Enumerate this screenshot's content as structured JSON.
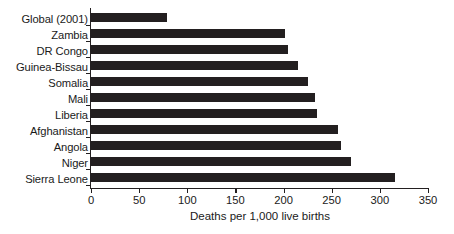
{
  "chart_data": {
    "type": "bar",
    "orientation": "horizontal",
    "title": "",
    "xlabel": "Deaths per 1,000 live births",
    "ylabel": "",
    "xlim": [
      0,
      350
    ],
    "xticks": [
      0,
      50,
      100,
      150,
      200,
      250,
      300,
      350
    ],
    "grid": false,
    "legend": false,
    "bar_color": "#231f20",
    "categories": [
      "Global (2001)",
      "Zambia",
      "DR Congo",
      "Guinea-Bissau",
      "Somalia",
      "Mali",
      "Liberia",
      "Afghanistan",
      "Angola",
      "Niger",
      "Sierra Leone"
    ],
    "values": [
      79,
      202,
      205,
      215,
      225,
      233,
      235,
      257,
      260,
      270,
      316
    ]
  }
}
